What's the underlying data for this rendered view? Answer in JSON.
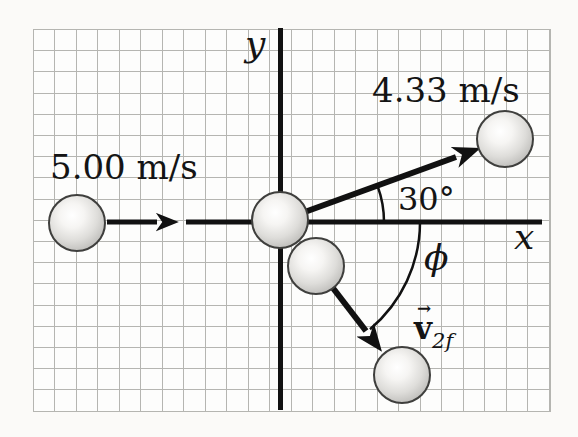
{
  "figure": {
    "type": "physics-vector-diagram",
    "description_labels": {
      "y_axis": "y",
      "x_axis": "x",
      "initial_velocity": "5.00 m/s",
      "final_velocity_ball1": "4.33 m/s",
      "angle_above_axis": "30°",
      "angle_below_axis": "ϕ",
      "v2f_vector_mark": "→",
      "v2f_base": "v",
      "v2f_subscript": "2f"
    },
    "colors": {
      "background": "#fbfaf8",
      "grid_line": "#b5b5b1",
      "axis_and_vectors": "#111111",
      "ball_highlight": "#ffffff",
      "ball_shade": "#a9a8a5",
      "ball_outline": "#3f3f3d"
    }
  }
}
